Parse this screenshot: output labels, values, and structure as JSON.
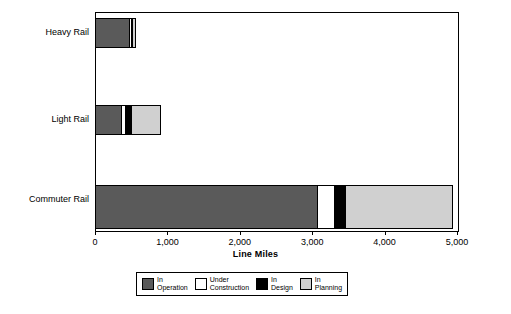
{
  "chart_data": {
    "type": "bar",
    "orientation": "horizontal",
    "stacked": true,
    "title": "",
    "xlabel": "Line Miles",
    "ylabel": "",
    "xlim": [
      0,
      5000
    ],
    "xticks": [
      0,
      1000,
      2000,
      3000,
      4000,
      5000
    ],
    "xticklabels": [
      "0",
      "1,000",
      "2,000",
      "3,000",
      "4,000",
      "5,000"
    ],
    "grid": false,
    "legend_position": "bottom",
    "categories": [
      "Heavy Rail",
      "Light Rail",
      "Commuter Rail"
    ],
    "series": [
      {
        "name": "In Operation",
        "label_line1": "In",
        "label_line2": "Operation",
        "color": "#5a5a5a",
        "values": [
          480,
          370,
          3080
        ]
      },
      {
        "name": "Under Construction",
        "label_line1": "Under",
        "label_line2": "Construction",
        "color": "#ffffff",
        "values": [
          40,
          70,
          250
        ]
      },
      {
        "name": "In Design",
        "label_line1": "In",
        "label_line2": "Design",
        "color": "#000000",
        "values": [
          15,
          100,
          170
        ]
      },
      {
        "name": "In Planning",
        "label_line1": "In",
        "label_line2": "Planning",
        "color": "#d0d0d0",
        "values": [
          55,
          410,
          1480
        ]
      }
    ],
    "totals": [
      590,
      950,
      4980
    ]
  },
  "axis": {
    "x_title": "Line Miles",
    "ticks": [
      {
        "value": 0,
        "label": "0"
      },
      {
        "value": 1000,
        "label": "1,000"
      },
      {
        "value": 2000,
        "label": "2,000"
      },
      {
        "value": 3000,
        "label": "3,000"
      },
      {
        "value": 4000,
        "label": "4,000"
      },
      {
        "value": 5000,
        "label": "5,000"
      }
    ]
  },
  "categories": [
    {
      "label": "Heavy Rail"
    },
    {
      "label": "Light Rail"
    },
    {
      "label": "Commuter Rail"
    }
  ],
  "legend": {
    "items": [
      {
        "line1": "In",
        "line2": "Operation",
        "color": "#5a5a5a"
      },
      {
        "line1": "Under",
        "line2": "Construction",
        "color": "#ffffff"
      },
      {
        "line1": "In",
        "line2": "Design",
        "color": "#000000"
      },
      {
        "line1": "In",
        "line2": "Planning",
        "color": "#d0d0d0"
      }
    ]
  }
}
